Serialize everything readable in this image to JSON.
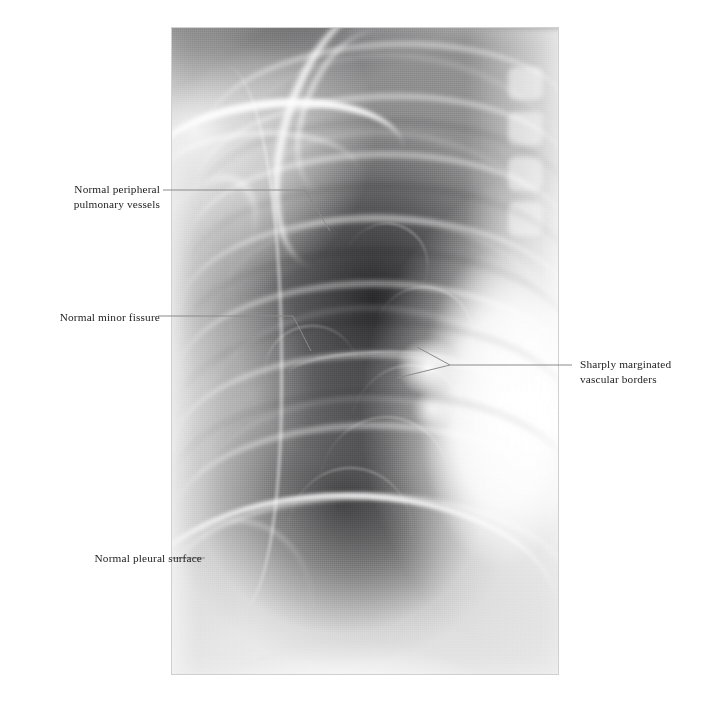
{
  "figure": {
    "type": "annotated-medical-radiograph",
    "modality": "chest radiograph",
    "view": "frontal right hemithorax detail",
    "background_color": "#ffffff",
    "label_text_color": "#1d1d1f",
    "leader_line_color": "#8a8a8a",
    "image_frame": {
      "x": 172,
      "y": 28,
      "width": 386,
      "height": 646
    }
  },
  "annotations": [
    {
      "id": "peripheral-vessels",
      "label": "Normal peripheral\npulmonary vessels",
      "side": "left",
      "text_x": 56,
      "text_y": 182,
      "leader": [
        [
          163,
          190
        ],
        [
          305,
          190
        ],
        [
          330,
          231
        ]
      ]
    },
    {
      "id": "minor-fissure",
      "label": "Normal minor fissure",
      "side": "left",
      "text_x": 44,
      "text_y": 310,
      "leader": [
        [
          158,
          316
        ],
        [
          293,
          316
        ],
        [
          311,
          351
        ]
      ]
    },
    {
      "id": "vascular-borders",
      "label": "Sharply marginated\nvascular borders",
      "side": "right",
      "text_x": 580,
      "text_y": 357,
      "leader": [
        [
          572,
          365
        ],
        [
          450,
          365
        ]
      ],
      "fork": [
        [
          [
            450,
            365
          ],
          [
            417,
            347
          ]
        ],
        [
          [
            450,
            365
          ],
          [
            397,
            378
          ]
        ]
      ]
    },
    {
      "id": "pleural-surface",
      "label": "Normal pleural surface",
      "side": "left",
      "text_x": 62,
      "text_y": 552,
      "leader": [
        [
          205,
          558
        ],
        [
          172,
          558
        ]
      ]
    }
  ]
}
